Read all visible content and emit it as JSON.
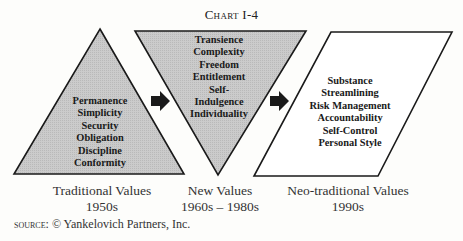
{
  "title": "Chart I-4",
  "stages": [
    {
      "shape": "triangle-up",
      "fill": "#c8c8c8",
      "items": [
        "Permanence",
        "Simplicity",
        "Security",
        "Obligation",
        "Discipline",
        "Conformity"
      ],
      "label": "Traditional Values",
      "period": "1950s"
    },
    {
      "shape": "triangle-down",
      "fill": "#c8c8c8",
      "items": [
        "Transience",
        "Complexity",
        "Freedom",
        "Entitlement",
        "Self-",
        "Indulgence",
        "Individuality"
      ],
      "label": "New Values",
      "period": "1960s – 1980s"
    },
    {
      "shape": "parallelogram",
      "fill": "#ffffff",
      "items": [
        "Substance",
        "Streamlining",
        "Risk Management",
        "Accountability",
        "Self-Control",
        "Personal Style"
      ],
      "label": "Neo-traditional Values",
      "period": "1990s"
    }
  ],
  "arrows": [
    "arrow-right",
    "arrow-right"
  ],
  "source": {
    "prefix": "source:",
    "text": "© Yankelovich Partners, Inc."
  }
}
